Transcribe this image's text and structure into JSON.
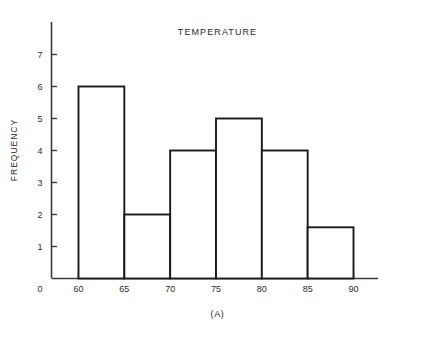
{
  "chart_data": {
    "type": "bar",
    "title": "TEMPERATURE",
    "caption": "(A)",
    "xlabel": "",
    "ylabel": "FREQUENCY",
    "bin_edges": [
      60,
      65,
      70,
      75,
      80,
      85,
      90
    ],
    "categories": [
      "60-65",
      "65-70",
      "70-75",
      "75-80",
      "80-85",
      "85-90"
    ],
    "values": [
      6,
      2,
      4,
      5,
      4,
      1.6
    ],
    "xlim": [
      60,
      90
    ],
    "ylim": [
      0,
      7
    ],
    "x_tick_labels": [
      "0",
      "60",
      "65",
      "70",
      "75",
      "80",
      "85",
      "90"
    ],
    "y_tick_labels": [
      "1",
      "2",
      "3",
      "4",
      "5",
      "6",
      "7"
    ],
    "y_tick_values": [
      1,
      2,
      3,
      4,
      5,
      6,
      7
    ],
    "grid": false,
    "legend": false,
    "bar_fill": "#ffffff",
    "bar_stroke": "#1a1a1a",
    "axis_color": "#3c3c3c",
    "background": "#ffffff"
  },
  "origin_label": "0"
}
